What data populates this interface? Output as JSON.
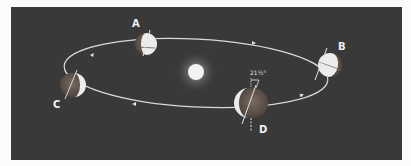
{
  "diagram": {
    "title": "",
    "sun": {
      "label": ""
    },
    "positions": [
      {
        "id": "A",
        "label": "A"
      },
      {
        "id": "B",
        "label": "B"
      },
      {
        "id": "C",
        "label": "C"
      },
      {
        "id": "D",
        "label": "D"
      }
    ],
    "tilt_label": "21½°",
    "colors": {
      "background": "#393939",
      "orbit": "#d8d8d8",
      "sun": "#f4f4f4",
      "earth_light": "#ececec",
      "earth_dark": "#6a5a52"
    }
  }
}
